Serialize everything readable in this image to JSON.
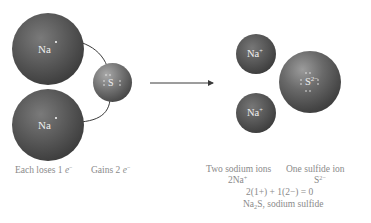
{
  "diagram": {
    "reactants": {
      "sodium_atoms": [
        {
          "symbol": "Na",
          "electron_dots": 1
        },
        {
          "symbol": "Na",
          "electron_dots": 1
        }
      ],
      "sulfur_atom": {
        "symbol": "S",
        "electron_dots": 6
      }
    },
    "products": {
      "sodium_ions": [
        {
          "symbol": "Na",
          "charge": "+"
        },
        {
          "symbol": "Na",
          "charge": "+"
        }
      ],
      "sulfide_ion": {
        "symbol": "S",
        "charge": "2−",
        "electron_dots": 8
      }
    },
    "captions": {
      "na_loss": "Each loses 1 ",
      "electron": "e",
      "electron_charge": "−",
      "s_gain": "Gains 2 ",
      "sodium_ions_label": "Two sodium ions",
      "sodium_ions_formula": "2Na",
      "sodium_ions_charge": "+",
      "sulfide_label": "One sulfide ion",
      "sulfide_formula": "S",
      "sulfide_charge": "2−",
      "charge_balance": "2(1+) + 1(2−) = 0",
      "compound_prefix": "Na",
      "compound_sub": "2",
      "compound_suffix": "S, sodium sulfide"
    },
    "colors": {
      "background": "#ffffff",
      "atom_dark": "#3a3a3a",
      "atom_light": "#7a7a7a",
      "symbol_text": "#f0f0f0",
      "caption_text": "#8a8a8a",
      "line": "#3a3a3a"
    }
  }
}
